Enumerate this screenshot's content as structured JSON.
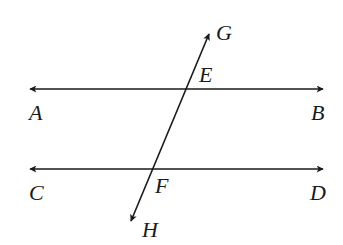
{
  "diagram": {
    "lines": [
      {
        "name": "AB",
        "start_label": "A",
        "end_label": "B"
      },
      {
        "name": "CD",
        "start_label": "C",
        "end_label": "D"
      },
      {
        "name": "GH",
        "start_label": "G",
        "end_label": "H"
      }
    ],
    "labels": {
      "A": "A",
      "B": "B",
      "C": "C",
      "D": "D",
      "E": "E",
      "F": "F",
      "G": "G",
      "H": "H"
    },
    "colors": {
      "stroke": "#1a1a1a",
      "background": "#ffffff"
    }
  }
}
